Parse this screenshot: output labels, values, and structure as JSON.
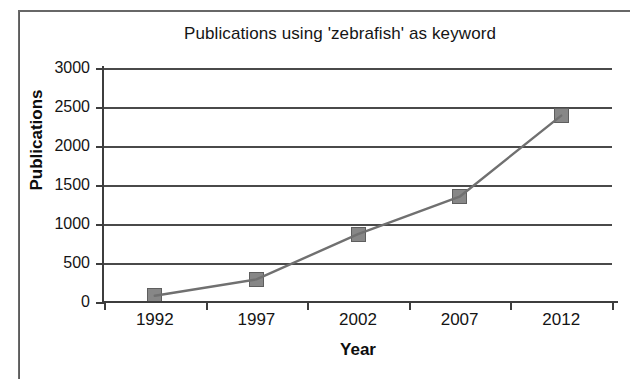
{
  "chart_data": {
    "type": "line",
    "title": "Publications using 'zebrafish' as keyword",
    "xlabel": "Year",
    "ylabel": "Publications",
    "categories": [
      "1992",
      "1997",
      "2002",
      "2007",
      "2012"
    ],
    "values": [
      80,
      290,
      870,
      1350,
      2390
    ],
    "series": [
      {
        "name": "Publications",
        "values": [
          80,
          290,
          870,
          1350,
          2390
        ]
      }
    ],
    "ylim": [
      0,
      3000
    ],
    "yticks": [
      "0",
      "500",
      "1000",
      "1500",
      "2000",
      "2500",
      "3000"
    ],
    "ytick_values": [
      0,
      500,
      1000,
      1500,
      2000,
      2500,
      3000
    ],
    "xticks": [
      "1992",
      "1997",
      "2002",
      "2007",
      "2012"
    ],
    "grid": "horizontal",
    "legend": "none",
    "marker": "square",
    "colors": {
      "line": "#707070",
      "marker_fill": "#878787",
      "marker_edge": "#5e5e5e",
      "gridline": "#4a4a4a",
      "axis": "#3d3d3d",
      "text": "#141414",
      "background": "#ffffff"
    }
  }
}
